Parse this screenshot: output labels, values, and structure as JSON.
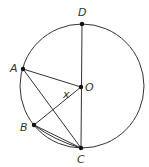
{
  "diagram": {
    "circle": {
      "cx": 82,
      "cy": 86,
      "r": 62
    },
    "points": {
      "A": {
        "x": 23,
        "y": 69,
        "label": "A",
        "lx": 10,
        "ly": 72
      },
      "B": {
        "x": 34,
        "y": 125,
        "label": "B",
        "lx": 20,
        "ly": 131
      },
      "C": {
        "x": 81,
        "y": 148,
        "label": "C",
        "lx": 77,
        "ly": 163
      },
      "D": {
        "x": 82,
        "y": 24,
        "label": "D",
        "lx": 78,
        "ly": 16
      },
      "O": {
        "x": 81,
        "y": 87,
        "label": "O",
        "lx": 85,
        "ly": 91
      }
    },
    "angle_label": {
      "text": "x",
      "x": 63,
      "y": 98
    },
    "segments": [
      [
        "D",
        "C"
      ],
      [
        "A",
        "O"
      ],
      [
        "A",
        "C"
      ],
      [
        "B",
        "O"
      ],
      [
        "B",
        "C"
      ]
    ],
    "stroke_color": "#333333"
  }
}
